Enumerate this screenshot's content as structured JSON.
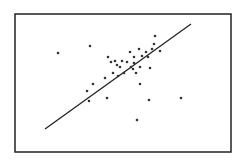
{
  "chart_data": {
    "type": "scatter",
    "title": "",
    "xlabel": "",
    "ylabel": "",
    "grid": false,
    "legend": null,
    "axis_ticks_shown": false,
    "units": "pixel coordinates within frame (x: 15-231 left-to-right, y: 14-152 top-to-bottom); no axis scale shown",
    "frame": {
      "x0": 15,
      "y0": 14,
      "x1": 231,
      "y1": 152
    },
    "series": [
      {
        "name": "points",
        "points": [
          [
            58,
            53
          ],
          [
            90,
            46
          ],
          [
            155,
            36
          ],
          [
            154,
            44
          ],
          [
            152,
            49
          ],
          [
            160,
            51
          ],
          [
            146,
            52
          ],
          [
            139,
            49
          ],
          [
            130,
            52
          ],
          [
            142,
            56
          ],
          [
            148,
            57
          ],
          [
            134,
            57
          ],
          [
            108,
            57
          ],
          [
            115,
            61
          ],
          [
            122,
            61
          ],
          [
            111,
            62
          ],
          [
            127,
            62
          ],
          [
            134,
            63
          ],
          [
            117,
            65
          ],
          [
            120,
            67
          ],
          [
            131,
            67
          ],
          [
            140,
            67
          ],
          [
            150,
            68
          ],
          [
            133,
            69
          ],
          [
            113,
            73
          ],
          [
            124,
            73
          ],
          [
            136,
            73
          ],
          [
            118,
            76
          ],
          [
            105,
            78
          ],
          [
            93,
            84
          ],
          [
            140,
            84
          ],
          [
            87,
            91
          ],
          [
            107,
            98
          ],
          [
            89,
            101
          ],
          [
            149,
            100
          ],
          [
            181,
            98
          ],
          [
            137,
            120
          ]
        ]
      }
    ],
    "fit_line": {
      "type": "linear regression",
      "start": [
        45,
        129
      ],
      "end": [
        191,
        24
      ]
    },
    "colors": {
      "points": "#333333",
      "line": "#222222",
      "frame": "#222222",
      "background": "#ffffff"
    }
  }
}
